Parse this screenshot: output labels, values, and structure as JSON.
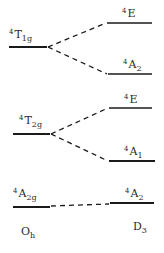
{
  "diagram": {
    "type": "correlation-diagram",
    "left_group": "Oh",
    "right_group": "D3",
    "left_levels": [
      {
        "id": "T1g",
        "mult": "4",
        "sym": "T",
        "sub": "1g",
        "y": 47,
        "x1": 9,
        "x2": 47
      },
      {
        "id": "T2g",
        "mult": "4",
        "sym": "T",
        "sub": "2g",
        "y": 134,
        "x1": 13,
        "x2": 50
      },
      {
        "id": "A2g",
        "mult": "4",
        "sym": "A",
        "sub": "2g",
        "y": 207,
        "x1": 13,
        "x2": 50
      }
    ],
    "right_levels": [
      {
        "id": "E_1",
        "mult": "4",
        "sym": "E",
        "sub": "",
        "y": 23,
        "x1": 107,
        "x2": 152
      },
      {
        "id": "A2_1",
        "mult": "4",
        "sym": "A",
        "sub": "2",
        "y": 74,
        "x1": 108,
        "x2": 152
      },
      {
        "id": "E_2",
        "mult": "4",
        "sym": "E",
        "sub": "",
        "y": 108,
        "x1": 109,
        "x2": 152
      },
      {
        "id": "A1",
        "mult": "4",
        "sym": "A",
        "sub": "1",
        "y": 161,
        "x1": 109,
        "x2": 155
      },
      {
        "id": "A2_2",
        "mult": "4",
        "sym": "A",
        "sub": "2",
        "y": 203,
        "x1": 110,
        "x2": 154
      }
    ],
    "correlations": [
      {
        "from": "T1g",
        "to": "E_1"
      },
      {
        "from": "T1g",
        "to": "A2_1"
      },
      {
        "from": "T2g",
        "to": "E_2"
      },
      {
        "from": "T2g",
        "to": "A1"
      },
      {
        "from": "A2g",
        "to": "A2_2"
      }
    ],
    "labels": {
      "T1g": {
        "mult": "4",
        "main": "T",
        "sub": "1g"
      },
      "T2g": {
        "mult": "4",
        "main": "T",
        "sub": "2g"
      },
      "A2g": {
        "mult": "4",
        "main": "A",
        "sub": "2g"
      },
      "E_1": {
        "mult": "4",
        "main": "E",
        "sub": ""
      },
      "A2_1": {
        "mult": "4",
        "main": "A",
        "sub": "2"
      },
      "E_2": {
        "mult": "4",
        "main": "E",
        "sub": ""
      },
      "A1": {
        "mult": "4",
        "main": "A",
        "sub": "1"
      },
      "A2_2": {
        "mult": "4",
        "main": "A",
        "sub": "2"
      },
      "Oh": {
        "main": "O",
        "sub": "h"
      },
      "D3": {
        "main": "D",
        "sub": "3"
      }
    },
    "colors": {
      "line": "#1a1a1a",
      "text": "#2a2a2a",
      "background": "#ffffff"
    }
  }
}
